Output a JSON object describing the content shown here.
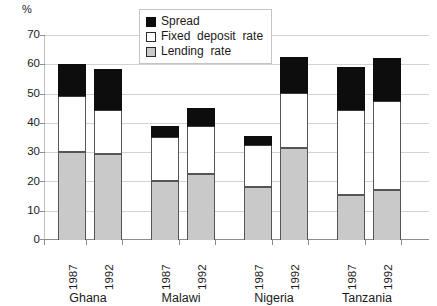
{
  "chart_data": {
    "type": "bar",
    "stacked": true,
    "title": "",
    "xlabel": "",
    "ylabel": "%",
    "ylim": [
      0,
      70
    ],
    "ytick_step": 10,
    "yticks": [
      "70",
      "60",
      "50",
      "40",
      "30",
      "20",
      "10",
      "0"
    ],
    "grid": true,
    "legend_position": "top-center",
    "categories": [
      "Ghana 1987",
      "Ghana 1992",
      "Malawi 1987",
      "Malawi 1992",
      "Nigeria 1987",
      "Nigeria 1992",
      "Tanzania 1987",
      "Tanzania 1992"
    ],
    "groups": [
      {
        "country": "Ghana",
        "years": [
          "1987",
          "1992"
        ]
      },
      {
        "country": "Malawi",
        "years": [
          "1987",
          "1992"
        ]
      },
      {
        "country": "Nigeria",
        "years": [
          "1987",
          "1992"
        ]
      },
      {
        "country": "Tanzania",
        "years": [
          "1987",
          "1992"
        ]
      }
    ],
    "series": [
      {
        "name": "Lending rate",
        "color": "#c9c9c9",
        "values": [
          30.0,
          29.5,
          20.0,
          22.5,
          18.0,
          31.5,
          15.5,
          17.0
        ]
      },
      {
        "name": "Fixed deposit rate",
        "color": "#ffffff",
        "values": [
          19.0,
          14.5,
          15.0,
          16.0,
          14.0,
          18.5,
          28.5,
          30.0
        ]
      },
      {
        "name": "Spread",
        "color": "#0d0d0d",
        "values": [
          11.0,
          14.5,
          4.0,
          6.5,
          3.5,
          12.5,
          15.0,
          15.0
        ]
      }
    ],
    "cumulative_tops": {
      "lending": [
        30.0,
        29.5,
        20.0,
        22.5,
        18.0,
        31.5,
        15.5,
        17.0
      ],
      "fixed": [
        49.0,
        44.0,
        35.0,
        38.5,
        32.0,
        50.0,
        44.0,
        47.0
      ],
      "spread": [
        60.0,
        58.5,
        39.0,
        45.0,
        35.5,
        62.5,
        59.0,
        62.0
      ]
    }
  },
  "legend": {
    "items": [
      {
        "label": "Spread",
        "swatch": "black-square-icon"
      },
      {
        "label": "Fixed  deposit  rate",
        "swatch": "white-square-icon"
      },
      {
        "label": "Lending  rate",
        "swatch": "gray-square-icon"
      }
    ]
  },
  "axis": {
    "y_unit": "%",
    "y_ticks": [
      "70",
      "60",
      "50",
      "40",
      "30",
      "20",
      "10",
      "0"
    ]
  },
  "x_axis": {
    "years": [
      "1987",
      "1992",
      "1987",
      "1992",
      "1987",
      "1992",
      "1987",
      "1992"
    ],
    "countries": [
      "Ghana",
      "Malawi",
      "Nigeria",
      "Tanzania"
    ]
  }
}
